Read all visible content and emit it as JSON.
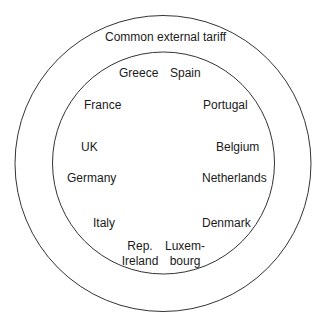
{
  "diagram": {
    "type": "nested-circles",
    "outer_ring": {
      "label": "Common external tariff",
      "center": [
        163,
        163
      ],
      "radius": 148
    },
    "inner_circle": {
      "center": [
        163,
        163
      ],
      "radius": 111,
      "members": [
        {
          "label": "Greece",
          "x": 119,
          "y": 66
        },
        {
          "label": "Spain",
          "x": 170,
          "y": 66
        },
        {
          "label": "France",
          "x": 84,
          "y": 98
        },
        {
          "label": "Portugal",
          "x": 203,
          "y": 98
        },
        {
          "label": "UK",
          "x": 81,
          "y": 140
        },
        {
          "label": "Belgium",
          "x": 216,
          "y": 140
        },
        {
          "label": "Germany",
          "x": 67,
          "y": 171
        },
        {
          "label": "Netherlands",
          "x": 202,
          "y": 171
        },
        {
          "label": "Italy",
          "x": 93,
          "y": 216
        },
        {
          "label": "Denmark",
          "x": 202,
          "y": 216
        },
        {
          "label": "Rep.",
          "label2": "Ireland",
          "x": 123,
          "y": 239
        },
        {
          "label": "Luxem-",
          "label2": "bourg",
          "x": 166,
          "y": 239
        }
      ]
    },
    "colors": {
      "stroke": "#333333",
      "text": "#1a1a1a",
      "background": "#ffffff"
    }
  }
}
